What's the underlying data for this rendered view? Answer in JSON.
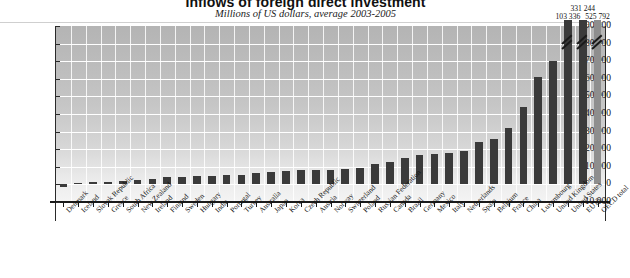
{
  "chart": {
    "title": "Inflows of foreign direct investment",
    "subtitle": "Millions of US dollars, average 2003-2005"
  },
  "chart_data": {
    "type": "bar",
    "title": "Inflows of foreign direct investment",
    "subtitle": "Millions of US dollars, average 2003-2005",
    "xlabel": "",
    "ylabel": "Millions of US dollars",
    "ylim": [
      -10000,
      90000
    ],
    "yticks": [
      -10000,
      0,
      10000,
      20000,
      30000,
      40000,
      50000,
      60000,
      70000,
      80000,
      90000
    ],
    "ytick_labels": [
      "-10 000",
      "0",
      "10 000",
      "20 000",
      "30 000",
      "40 000",
      "50 000",
      "60 000",
      "70 000",
      "80 000",
      "90 000"
    ],
    "grid": true,
    "legend": false,
    "categories": [
      "Denmark",
      "Iceland",
      "Slovak Republic",
      "Greece",
      "South Africa",
      "New Zealand",
      "Ireland",
      "Finland",
      "Sweden",
      "Hungary",
      "India",
      "Portugal",
      "Turkey",
      "Australia",
      "Japan",
      "Korea",
      "Czech Republic",
      "Austria",
      "Norway",
      "Switzerland",
      "Poland",
      "Russian Federation",
      "Canada",
      "Brazil",
      "Germany",
      "Mexico",
      "Italy",
      "Netherlands",
      "Spain",
      "Belgium",
      "France",
      "China",
      "Luxembourg",
      "United Kingdom",
      "United States",
      "EU15",
      "OECD total"
    ],
    "values": [
      -1200,
      600,
      1500,
      1600,
      2200,
      2400,
      3200,
      4000,
      4200,
      4600,
      5000,
      5300,
      5600,
      6600,
      7000,
      7400,
      8000,
      8200,
      8400,
      9000,
      9500,
      11500,
      13000,
      15000,
      16500,
      17500,
      18000,
      19000,
      24000,
      26000,
      32000,
      44000,
      61000,
      70000,
      103336,
      331244,
      525792
    ],
    "annotations": [
      {
        "category": "United States",
        "label": "103 336",
        "truncated": true
      },
      {
        "category": "EU15",
        "label": "331 244",
        "truncated": true
      },
      {
        "category": "OECD total",
        "label": "525 792",
        "truncated": true
      }
    ]
  }
}
